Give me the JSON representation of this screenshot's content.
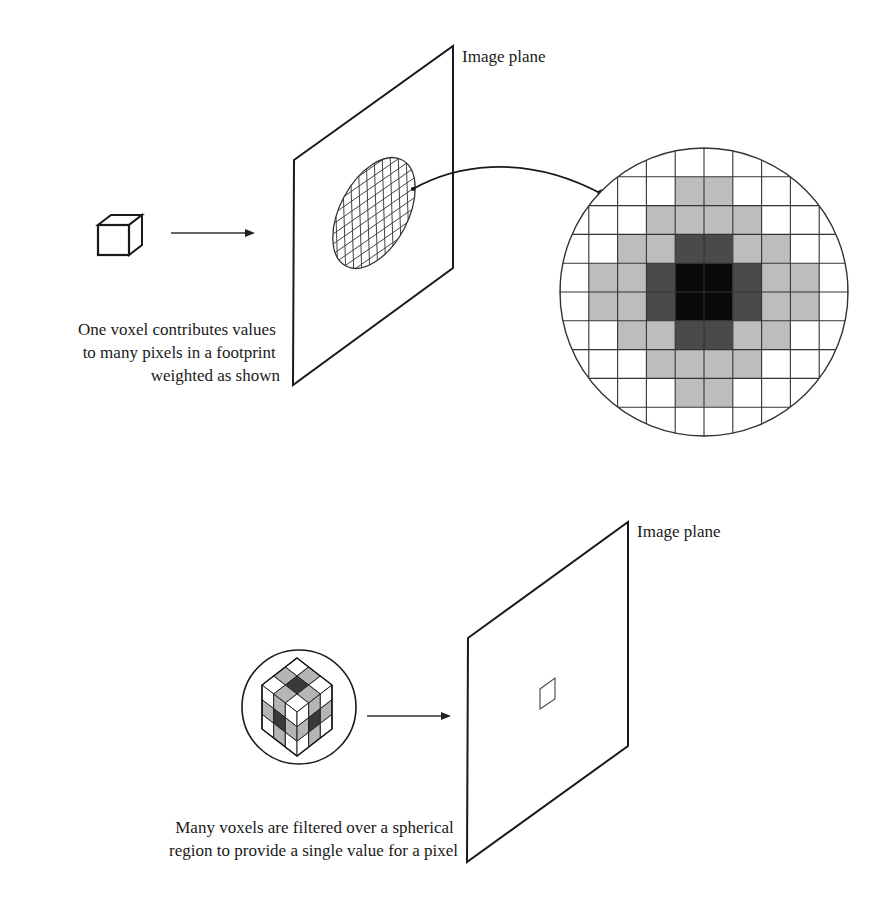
{
  "top_panel": {
    "plane_label": "Image plane",
    "caption_lines": [
      "One voxel contributes values",
      "to many pixels in a footprint",
      "weighted as shown"
    ],
    "source_icon": "voxel-cube-icon",
    "footprint": {
      "grid_size": 10,
      "cells_comment": "0=white, 1=light gray, 2=dark gray, 3=black",
      "rows": [
        [
          0,
          0,
          0,
          0,
          0,
          0,
          0,
          0,
          0,
          0
        ],
        [
          0,
          0,
          0,
          0,
          1,
          1,
          0,
          0,
          0,
          0
        ],
        [
          0,
          0,
          0,
          1,
          1,
          1,
          1,
          0,
          0,
          0
        ],
        [
          0,
          0,
          1,
          1,
          2,
          2,
          1,
          1,
          0,
          0
        ],
        [
          0,
          1,
          1,
          2,
          3,
          3,
          2,
          1,
          1,
          0
        ],
        [
          0,
          1,
          1,
          2,
          3,
          3,
          2,
          1,
          1,
          0
        ],
        [
          0,
          0,
          1,
          1,
          2,
          2,
          1,
          1,
          0,
          0
        ],
        [
          0,
          0,
          0,
          1,
          1,
          1,
          1,
          0,
          0,
          0
        ],
        [
          0,
          0,
          0,
          0,
          1,
          1,
          0,
          0,
          0,
          0
        ],
        [
          0,
          0,
          0,
          0,
          0,
          0,
          0,
          0,
          0,
          0
        ]
      ],
      "colors": [
        "#ffffff",
        "#bdbdbd",
        "#4a4a4a",
        "#0a0a0a"
      ]
    }
  },
  "bottom_panel": {
    "plane_label": "Image plane",
    "caption_lines": [
      "Many voxels are filtered over a spherical",
      "region to provide a single value for a pixel"
    ],
    "source_icon": "filtered-voxel-sphere-icon",
    "pixel_icon": "single-pixel-icon"
  }
}
